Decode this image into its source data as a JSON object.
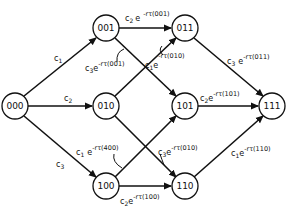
{
  "diagram": {
    "type": "state-transition-graph",
    "nodes": [
      {
        "id": "000",
        "label": "000",
        "x": 15,
        "y": 106
      },
      {
        "id": "001",
        "label": "001",
        "x": 106,
        "y": 28
      },
      {
        "id": "010",
        "label": "010",
        "x": 106,
        "y": 106
      },
      {
        "id": "100",
        "label": "100",
        "x": 106,
        "y": 186
      },
      {
        "id": "011",
        "label": "011",
        "x": 185,
        "y": 28
      },
      {
        "id": "101",
        "label": "101",
        "x": 185,
        "y": 106
      },
      {
        "id": "110",
        "label": "110",
        "x": 185,
        "y": 186
      },
      {
        "id": "111",
        "label": "111",
        "x": 272,
        "y": 106
      }
    ],
    "edges": [
      {
        "from": "000",
        "to": "001",
        "label": {
          "c": "c",
          "sub": "1",
          "exp": ""
        }
      },
      {
        "from": "000",
        "to": "010",
        "label": {
          "c": "c",
          "sub": "2",
          "exp": ""
        }
      },
      {
        "from": "000",
        "to": "100",
        "label": {
          "c": "c",
          "sub": "3",
          "exp": ""
        }
      },
      {
        "from": "001",
        "to": "011",
        "label": {
          "c": "c",
          "sub": "2",
          "exp": "-rτ(001)"
        }
      },
      {
        "from": "001",
        "to": "101",
        "label": {
          "c": "c",
          "sub": "3",
          "exp": "-rτ(001)"
        }
      },
      {
        "from": "010",
        "to": "011",
        "label": {
          "c": "c",
          "sub": "1",
          "exp": "-rτ(010)"
        }
      },
      {
        "from": "010",
        "to": "110",
        "label": {
          "c": "c",
          "sub": "3",
          "exp": "-rτ(010)"
        }
      },
      {
        "from": "100",
        "to": "101",
        "label": {
          "c": "c",
          "sub": "1",
          "exp": "-rτ(400)"
        }
      },
      {
        "from": "100",
        "to": "110",
        "label": {
          "c": "c",
          "sub": "2",
          "exp": "-rτ(100)"
        }
      },
      {
        "from": "011",
        "to": "111",
        "label": {
          "c": "c",
          "sub": "3",
          "exp": "-rτ(011)"
        }
      },
      {
        "from": "101",
        "to": "111",
        "label": {
          "c": "c",
          "sub": "2",
          "exp": "-rτ(101)"
        }
      },
      {
        "from": "110",
        "to": "111",
        "label": {
          "c": "c",
          "sub": "1",
          "exp": "-rτ(110)"
        }
      }
    ],
    "e_symbol": "e"
  }
}
